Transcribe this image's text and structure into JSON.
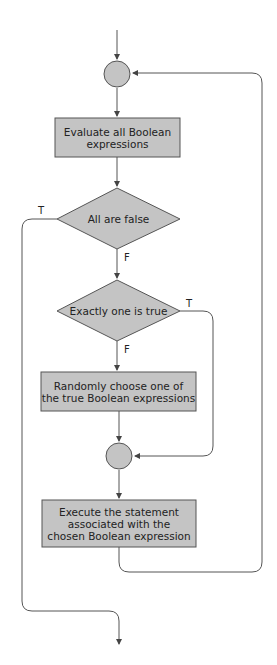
{
  "flowchart": {
    "nodes": {
      "evaluate": {
        "line1": "Evaluate all Boolean",
        "line2": "expressions"
      },
      "all_false": {
        "label": "All are false"
      },
      "exactly_one": {
        "label": "Exactly one is true"
      },
      "randomly": {
        "line1": "Randomly choose one of",
        "line2": "the true Boolean expressions"
      },
      "execute": {
        "line1": "Execute the statement",
        "line2": "associated with the",
        "line3": "chosen Boolean expression"
      }
    },
    "edge_labels": {
      "all_false_true": "T",
      "all_false_false": "F",
      "exactly_one_true": "T",
      "exactly_one_false": "F"
    },
    "colors": {
      "fill": "#c4c4c4",
      "stroke": "#555555"
    }
  }
}
